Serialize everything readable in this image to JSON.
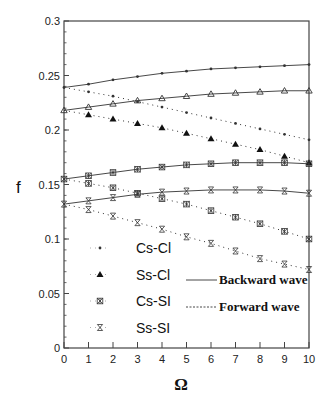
{
  "chart_data": {
    "type": "line",
    "title": "",
    "xlabel": "Ω",
    "ylabel": "f",
    "xlim": [
      0,
      10
    ],
    "ylim": [
      0,
      0.3
    ],
    "x_ticks": [
      0,
      1,
      2,
      3,
      4,
      5,
      6,
      7,
      8,
      9,
      10
    ],
    "x_tick_labels": [
      "0",
      "1",
      "2",
      "3",
      "4",
      "5",
      "6",
      "7",
      "8",
      "9",
      "10"
    ],
    "y_ticks": [
      0,
      0.05,
      0.1,
      0.15,
      0.2,
      0.25,
      0.3
    ],
    "y_tick_labels": [
      "0",
      "0.05",
      "0.1",
      "0.15",
      "0.2",
      "0.25",
      "0.3"
    ],
    "grid": false,
    "legend_position": "lower-left inside",
    "x": [
      0,
      1,
      2,
      3,
      4,
      5,
      6,
      7,
      8,
      9,
      10
    ],
    "series": [
      {
        "name": "Cs-Cl",
        "marker": "dot",
        "wave": "Backward wave",
        "style": "solid",
        "values": [
          0.239,
          0.242,
          0.246,
          0.249,
          0.252,
          0.254,
          0.256,
          0.257,
          0.258,
          0.259,
          0.26
        ]
      },
      {
        "name": "Cs-Cl",
        "marker": "dot",
        "wave": "Forward wave",
        "style": "dotted",
        "values": [
          0.239,
          0.235,
          0.231,
          0.226,
          0.221,
          0.216,
          0.211,
          0.206,
          0.201,
          0.196,
          0.191
        ]
      },
      {
        "name": "Ss-Cl",
        "marker": "triangle",
        "wave": "Backward wave",
        "style": "solid",
        "values": [
          0.218,
          0.221,
          0.224,
          0.227,
          0.229,
          0.231,
          0.233,
          0.234,
          0.235,
          0.236,
          0.236
        ]
      },
      {
        "name": "Ss-Cl",
        "marker": "triangle",
        "wave": "Forward wave",
        "style": "dotted",
        "values": [
          0.218,
          0.214,
          0.21,
          0.206,
          0.202,
          0.197,
          0.192,
          0.187,
          0.182,
          0.176,
          0.17
        ]
      },
      {
        "name": "Cs-SI",
        "marker": "asterisk-box",
        "wave": "Backward wave",
        "style": "solid",
        "values": [
          0.155,
          0.158,
          0.161,
          0.164,
          0.166,
          0.168,
          0.169,
          0.17,
          0.17,
          0.17,
          0.169
        ]
      },
      {
        "name": "Cs-SI",
        "marker": "asterisk-box",
        "wave": "Forward wave",
        "style": "dotted",
        "values": [
          0.155,
          0.151,
          0.147,
          0.142,
          0.137,
          0.132,
          0.126,
          0.12,
          0.114,
          0.107,
          0.1
        ]
      },
      {
        "name": "Ss-SI",
        "marker": "hourglass",
        "wave": "Backward wave",
        "style": "solid",
        "values": [
          0.132,
          0.135,
          0.138,
          0.141,
          0.143,
          0.144,
          0.145,
          0.145,
          0.145,
          0.144,
          0.142
        ]
      },
      {
        "name": "Ss-SI",
        "marker": "hourglass",
        "wave": "Forward wave",
        "style": "dotted",
        "values": [
          0.132,
          0.127,
          0.121,
          0.115,
          0.109,
          0.102,
          0.096,
          0.089,
          0.082,
          0.077,
          0.072
        ]
      }
    ],
    "legend": {
      "markers": [
        {
          "label": "Cs-Cl",
          "marker": "dot"
        },
        {
          "label": "Ss-Cl",
          "marker": "triangle"
        },
        {
          "label": "Cs-SI",
          "marker": "asterisk-box"
        },
        {
          "label": "Ss-SI",
          "marker": "hourglass"
        }
      ],
      "lines": [
        {
          "label": "Backward wave",
          "style": "solid"
        },
        {
          "label": "Forward wave",
          "style": "dotted"
        }
      ]
    }
  },
  "colors": {
    "line": "#333333",
    "axis": "#444444",
    "text": "#111111"
  }
}
